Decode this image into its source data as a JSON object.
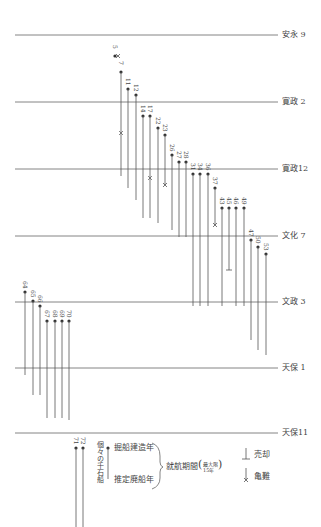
{
  "eras": [
    {
      "label": "安永 9",
      "y": 35
    },
    {
      "label": "寛政 2",
      "y": 102
    },
    {
      "label": "寛政12",
      "y": 169
    },
    {
      "label": "文化 7",
      "y": 236
    },
    {
      "label": "文政 3",
      "y": 302
    },
    {
      "label": "天保 1",
      "y": 368
    },
    {
      "label": "天保11",
      "y": 433
    }
  ],
  "ships": [
    {
      "id": "5",
      "x": 115,
      "top": 56,
      "bottom": 56,
      "end": "wreck"
    },
    {
      "id": "7",
      "x": 121,
      "top": 72,
      "bottom": 176,
      "end": "none",
      "mark_y": 133
    },
    {
      "id": "11",
      "x": 128,
      "top": 89,
      "bottom": 188,
      "end": "none"
    },
    {
      "id": "12",
      "x": 136,
      "top": 95,
      "bottom": 200,
      "end": "none"
    },
    {
      "id": "14",
      "x": 143,
      "top": 116,
      "bottom": 218,
      "end": "none"
    },
    {
      "id": "17",
      "x": 150,
      "top": 116,
      "bottom": 218,
      "end": "none",
      "mark_y": 178
    },
    {
      "id": "22",
      "x": 158,
      "top": 128,
      "bottom": 223,
      "end": "none"
    },
    {
      "id": "23",
      "x": 165,
      "top": 135,
      "bottom": 185,
      "end": "wreck"
    },
    {
      "id": "26",
      "x": 172,
      "top": 155,
      "bottom": 230,
      "end": "none"
    },
    {
      "id": "27",
      "x": 179,
      "top": 162,
      "bottom": 237,
      "end": "none"
    },
    {
      "id": "28",
      "x": 186,
      "top": 162,
      "bottom": 237,
      "end": "none"
    },
    {
      "id": "31",
      "x": 193,
      "top": 174,
      "bottom": 306,
      "end": "none"
    },
    {
      "id": "34",
      "x": 200,
      "top": 174,
      "bottom": 306,
      "end": "none"
    },
    {
      "id": "36",
      "x": 208,
      "top": 174,
      "bottom": 306,
      "end": "none"
    },
    {
      "id": "37",
      "x": 215,
      "top": 188,
      "bottom": 225,
      "end": "wreck"
    },
    {
      "id": "43",
      "x": 222,
      "top": 208,
      "bottom": 306,
      "end": "none"
    },
    {
      "id": "45",
      "x": 229,
      "top": 208,
      "bottom": 270,
      "end": "sold"
    },
    {
      "id": "46",
      "x": 236,
      "top": 208,
      "bottom": 306,
      "end": "none"
    },
    {
      "id": "49",
      "x": 244,
      "top": 208,
      "bottom": 306,
      "end": "none"
    },
    {
      "id": "47",
      "x": 251,
      "top": 240,
      "bottom": 340,
      "end": "none"
    },
    {
      "id": "50",
      "x": 258,
      "top": 247,
      "bottom": 350,
      "end": "none"
    },
    {
      "id": "53",
      "x": 266,
      "top": 254,
      "bottom": 355,
      "end": "none"
    },
    {
      "id": "64",
      "x": 25,
      "top": 292,
      "bottom": 375,
      "end": "none"
    },
    {
      "id": "65",
      "x": 33,
      "top": 301,
      "bottom": 395,
      "end": "none"
    },
    {
      "id": "66",
      "x": 40,
      "top": 306,
      "bottom": 395,
      "end": "none"
    },
    {
      "id": "67",
      "x": 47,
      "top": 321,
      "bottom": 418,
      "end": "none"
    },
    {
      "id": "68",
      "x": 55,
      "top": 321,
      "bottom": 418,
      "end": "none"
    },
    {
      "id": "69",
      "x": 62,
      "top": 321,
      "bottom": 418,
      "end": "none"
    },
    {
      "id": "70",
      "x": 69,
      "top": 321,
      "bottom": 420,
      "end": "none"
    },
    {
      "id": "71",
      "x": 76,
      "top": 448,
      "bottom": 527,
      "end": "none"
    },
    {
      "id": "72",
      "x": 83,
      "top": 448,
      "bottom": 527,
      "end": "none"
    }
  ],
  "legend": {
    "ship_label": "個々の千石船",
    "build_year": "掘船建造年",
    "scrap_year": "推定廃船年",
    "period": "就航期間",
    "max_line1": "最大限",
    "max_line2": "15年",
    "sold": "売却",
    "wreck": "亀難"
  },
  "colors": {
    "line": "#555555",
    "era_line": "#666666",
    "text": "#444444"
  }
}
